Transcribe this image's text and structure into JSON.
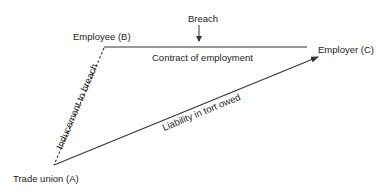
{
  "diagram": {
    "nodes": {
      "employee": "Employee (B)",
      "employer": "Employer (C)",
      "trade_union": "Trade union (A)"
    },
    "edges": {
      "contract": "Contract of employment",
      "inducement": "Inducement to breach",
      "liability": "Liability in tort owed"
    },
    "annotation": {
      "breach": "Breach"
    },
    "colors": {
      "line": "#333333",
      "text": "#222222"
    }
  }
}
